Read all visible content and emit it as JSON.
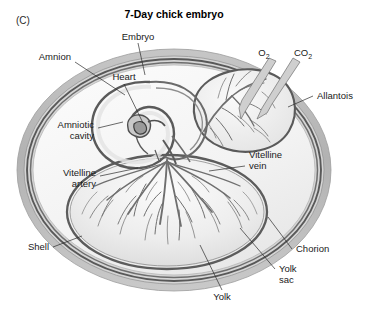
{
  "figure": {
    "panel_label": "(C)",
    "title": "7-Day chick embryo"
  },
  "labels": {
    "embryo": "Embryo",
    "amnion": "Amnion",
    "heart": "Heart",
    "amniotic_cavity_line1": "Amniotic",
    "amniotic_cavity_line2": "cavity",
    "vitelline_artery_line1": "Vitelline",
    "vitelline_artery_line2": "artery",
    "shell": "Shell",
    "oxygen": "O",
    "oxygen_sub": "2",
    "carbon_dioxide": "CO",
    "carbon_dioxide_sub": "2",
    "allantois": "Allantois",
    "vitelline_vein_line1": "Vitelline",
    "vitelline_vein_line2": "vein",
    "chorion": "Chorion",
    "yolk_sac_line1": "Yolk",
    "yolk_sac_line2": "sac",
    "yolk": "Yolk"
  },
  "colors": {
    "background": "#ffffff",
    "shell_outer": "#b9b9b9",
    "shell_inner": "#d8d8d8",
    "membrane_dark": "#5a5a5a",
    "membrane_mid": "#8a8a8a",
    "albumen": "#f2f2f2",
    "yolk_fill": "#e9e9e9",
    "allantois_fill": "#ededed",
    "vessel": "#707070",
    "embryo_dark": "#4f4f4f",
    "text": "#1a1a1a"
  },
  "structures": [
    {
      "name": "shell",
      "description": "outer egg shell layered band"
    },
    {
      "name": "chorion",
      "description": "membrane just inside shell"
    },
    {
      "name": "allantois",
      "description": "vascular sac at upper right"
    },
    {
      "name": "amnion",
      "description": "membrane around embryo"
    },
    {
      "name": "amniotic-cavity",
      "description": "fluid space around embryo"
    },
    {
      "name": "embryo",
      "description": "curled chick embryo with heart"
    },
    {
      "name": "yolk-sac",
      "description": "large vascularized sac enclosing yolk"
    },
    {
      "name": "yolk",
      "description": "yolk mass inside yolk sac"
    }
  ],
  "gas_exchange": [
    {
      "name": "oxygen-in",
      "direction": "inward"
    },
    {
      "name": "carbon-dioxide-out",
      "direction": "outward"
    }
  ]
}
